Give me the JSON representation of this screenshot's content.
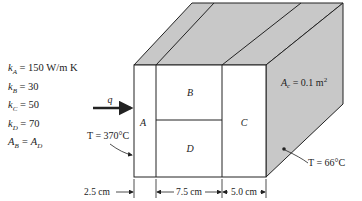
{
  "properties": [
    {
      "symbol": "k",
      "sub": "A",
      "text": " = 150 W/m K"
    },
    {
      "symbol": "k",
      "sub": "B",
      "text": " = 30"
    },
    {
      "symbol": "k",
      "sub": "C",
      "text": " = 50"
    },
    {
      "symbol": "k",
      "sub": "D",
      "text": " = 70"
    },
    {
      "symbol": "A",
      "sub": "B",
      "text": " = A",
      "sub2": "D"
    }
  ],
  "regions": {
    "A": "A",
    "B": "B",
    "C": "C",
    "D": "D"
  },
  "heat_flow_label": "q",
  "hot_side_temp": "T = 370°C",
  "cold_side_temp": "T = 66°C",
  "area_label": "A",
  "area_sub": "c",
  "area_value": " = 0.1 m",
  "area_sup": "2",
  "dimensions": [
    "2.5 cm",
    "7.5 cm",
    "5.0 cm"
  ],
  "colors": {
    "face": "#c8c8c8",
    "line": "#222222",
    "background": "#ffffff"
  }
}
